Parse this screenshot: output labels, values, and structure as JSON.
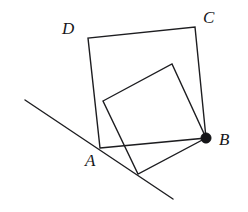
{
  "figure": {
    "canvas": {
      "width": 248,
      "height": 212,
      "background": "#ffffff"
    },
    "stroke_color": "#1d1d20",
    "label_color": "#17171a",
    "outer_square": {
      "name": "square-ABCD",
      "stroke_width": 1.4,
      "vertices": [
        {
          "label": "A",
          "x": 100,
          "y": 148
        },
        {
          "label": "B",
          "x": 206,
          "y": 138
        },
        {
          "label": "C",
          "x": 195,
          "y": 27
        },
        {
          "label": "D",
          "x": 88,
          "y": 38
        }
      ],
      "points_attr": "100,148 206,138 195,27 88,38"
    },
    "inner_square": {
      "name": "inner-rotated-square",
      "stroke_width": 1.4,
      "vertices": [
        {
          "label": "",
          "x": 103,
          "y": 101
        },
        {
          "label": "",
          "x": 172,
          "y": 64
        },
        {
          "label": "B",
          "x": 206,
          "y": 138
        },
        {
          "label": "",
          "x": 138,
          "y": 174
        }
      ],
      "points_attr": "103,101 172,64 206,138 138,174"
    },
    "transversal_line": {
      "name": "transversal-line",
      "stroke_width": 1.4,
      "x1": 25,
      "y1": 100,
      "x2": 173,
      "y2": 199
    },
    "marked_point": {
      "name": "point-B-dot",
      "x": 206,
      "y": 138,
      "radius": 5.2,
      "filled": true
    },
    "labels": [
      {
        "id": "label-D",
        "text": "D",
        "x": 62,
        "y": 20,
        "font_size": 17
      },
      {
        "id": "label-C",
        "text": "C",
        "x": 203,
        "y": 9,
        "font_size": 17
      },
      {
        "id": "label-A",
        "text": "A",
        "x": 85,
        "y": 152,
        "font_size": 17
      },
      {
        "id": "label-B",
        "text": "B",
        "x": 219,
        "y": 131,
        "font_size": 17
      }
    ]
  }
}
